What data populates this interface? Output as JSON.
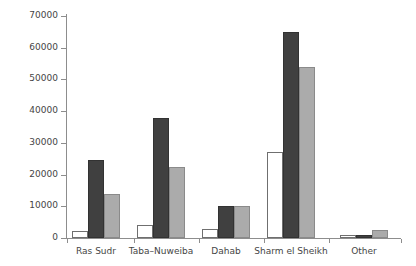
{
  "chart_data": {
    "type": "bar",
    "title": "",
    "subtitle": "",
    "xlabel": "",
    "ylabel": "Hotel rooms",
    "categories": [
      "Ras Sudr",
      "Taba–Nuweiba",
      "Dahab",
      "Sharm el Sheikh",
      "Other"
    ],
    "series": [
      {
        "name": "series-1-white",
        "color": "#ffffff",
        "values": [
          2200,
          4200,
          2900,
          27000,
          800
        ]
      },
      {
        "name": "series-2-dark",
        "color": "#404040",
        "values": [
          24500,
          37800,
          10000,
          65000,
          1100
        ]
      },
      {
        "name": "series-3-gray",
        "color": "#ababab",
        "values": [
          13800,
          22400,
          10000,
          54000,
          2500
        ]
      }
    ],
    "ylim": [
      0,
      70000
    ],
    "ytick_values": [
      0,
      10000,
      20000,
      30000,
      40000,
      50000,
      60000,
      70000
    ],
    "ytick_labels": [
      "0",
      "10000",
      "20000",
      "30000",
      "40000",
      "50000",
      "60000",
      "70000"
    ],
    "grid": false,
    "legend": null,
    "legend_position": "none",
    "annotations": []
  },
  "colors": {
    "axis": "#8d8d8d",
    "text": "#454545",
    "background": "#ffffff"
  }
}
